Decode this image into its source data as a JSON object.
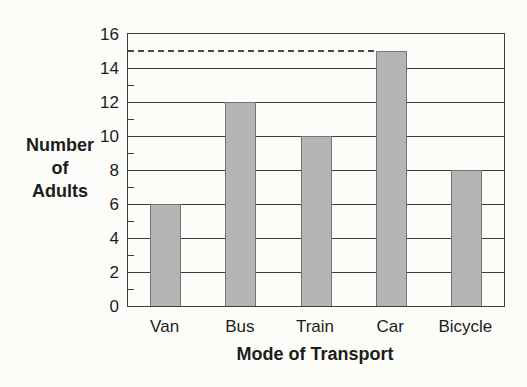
{
  "chart_data": {
    "type": "bar",
    "title": "",
    "categories": [
      "Van",
      "Bus",
      "Train",
      "Car",
      "Bicycle"
    ],
    "values": [
      6,
      12,
      10,
      15,
      8
    ],
    "xlabel": "Mode of Transport",
    "ylabel": "Number of Adults",
    "ylabel_lines": [
      "Number",
      "of",
      "Adults"
    ],
    "ylim": [
      0,
      16
    ],
    "yticks": [
      0,
      2,
      4,
      6,
      8,
      10,
      12,
      14,
      16
    ],
    "minor_ticks": [
      1,
      3,
      5,
      7,
      9,
      11,
      13,
      15
    ],
    "grid": "horizontal",
    "legend": "none",
    "dashed_guide_line": {
      "y": 15,
      "from": "y-axis",
      "to_category": "Car"
    },
    "colors": {
      "bar_fill": "#b5b5b5",
      "bar_border": "#757575",
      "axis_line": "#3d3d3d",
      "grid_line": "#3d3d3d",
      "dash_line": "#4a4a4a",
      "text": "#1c1c1c",
      "background": "#fcfcf9"
    }
  }
}
